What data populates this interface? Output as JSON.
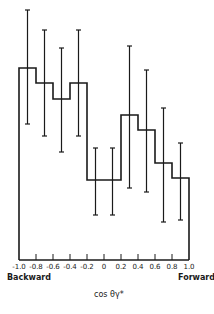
{
  "chart_data": {
    "type": "bar",
    "style": "step-histogram with error bars",
    "title": "",
    "xlabel": "cos θγ*",
    "ylabel": "",
    "x_annotations": {
      "left": "Backward",
      "right": "Forward"
    },
    "tick_labels": [
      "-1.0",
      "-0.8",
      "-0.6",
      "-0.4",
      "-0.2",
      "0",
      "0.2",
      "0.4",
      "0.6",
      "0.8",
      "1.0"
    ],
    "bin_edges": [
      -1.0,
      -0.8,
      -0.6,
      -0.4,
      -0.2,
      0,
      0.2,
      0.4,
      0.6,
      0.8,
      1.0
    ],
    "categories": [
      "-1.0 to -0.8",
      "-0.8 to -0.6",
      "-0.6 to -0.4",
      "-0.4 to -0.2",
      "-0.2 to 0",
      "0 to 0.2",
      "0.2 to 0.4",
      "0.4 to 0.6",
      "0.6 to 0.8",
      "0.8 to 1.0"
    ],
    "values": [
      192,
      177,
      161,
      177,
      80,
      80,
      145,
      130,
      97,
      82
    ],
    "error_upper": [
      250,
      230,
      212,
      230,
      112,
      112,
      214,
      190,
      152,
      117
    ],
    "error_lower": [
      136,
      124,
      108,
      124,
      45,
      45,
      72,
      68,
      38,
      40
    ],
    "units_note": "relative heights in pixels above baseline; no y-axis scale shown",
    "grid": false,
    "legend": null
  }
}
